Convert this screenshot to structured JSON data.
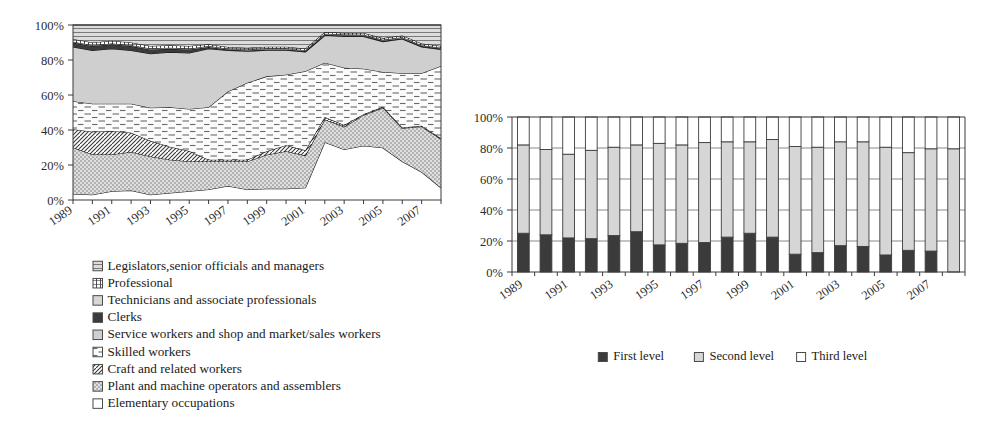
{
  "figure": {
    "panels": [
      "occupation-structure-area-chart",
      "education-level-bar-chart"
    ]
  },
  "colors": {
    "ink": "#1a1a1a",
    "axis": "#3a3a3a",
    "grid": "#7a7a7a",
    "edge": "#141414",
    "light_gray": "#d2d2d2",
    "mid_gray": "#c9c9c9",
    "pale_gray": "#e3e3e3",
    "dark": "#3a3a3a",
    "near_black": "#2e2e2e",
    "white": "#ffffff",
    "bar_first": "#5a5a5a",
    "bar_second": "#d4d4d4",
    "bar_third": "#ffffff"
  },
  "left_chart": {
    "y_axis": {
      "ticks": [
        "0%",
        "20%",
        "40%",
        "60%",
        "80%",
        "100%"
      ],
      "min": 0,
      "max": 100
    },
    "x_axis": {
      "labels": [
        "1989",
        "1991",
        "1993",
        "1995",
        "1997",
        "1999",
        "2001",
        "2003",
        "2005",
        "2007"
      ]
    },
    "legend": [
      {
        "label": "Legislators,senior officials and managers",
        "pattern": "horizontal-lines",
        "swatch": "swatch-legislators"
      },
      {
        "label": "Professional",
        "pattern": "vertical-grid",
        "swatch": "swatch-professional"
      },
      {
        "label": "Technicians and associate professionals",
        "pattern": "solid-light-gray",
        "swatch": "swatch-technicians"
      },
      {
        "label": "Clerks",
        "pattern": "solid-dark",
        "swatch": "swatch-clerks"
      },
      {
        "label": "Service workers and shop and market/sales workers",
        "pattern": "solid-gray",
        "swatch": "swatch-service"
      },
      {
        "label": "Skilled workers",
        "pattern": "dashed-lines",
        "swatch": "swatch-skilled"
      },
      {
        "label": "Craft and related workers",
        "pattern": "diagonal-hatch",
        "swatch": "swatch-craft"
      },
      {
        "label": "Plant and machine operators and assemblers",
        "pattern": "dotted-grid",
        "swatch": "swatch-plant"
      },
      {
        "label": "Elementary occupations",
        "pattern": "blank-white",
        "swatch": "swatch-elementary"
      }
    ]
  },
  "right_chart": {
    "y_axis": {
      "ticks": [
        "0%",
        "20%",
        "40%",
        "60%",
        "80%",
        "100%"
      ],
      "min": 0,
      "max": 100
    },
    "x_axis": {
      "labels": [
        "1989",
        "1991",
        "1993",
        "1995",
        "1997",
        "1999",
        "2001",
        "2003",
        "2005",
        "2007"
      ]
    },
    "legend": [
      {
        "label": "First level",
        "pattern": "solid-dark",
        "swatch": "swatch-first-level"
      },
      {
        "label": "Second level",
        "pattern": "solid-light-gray",
        "swatch": "swatch-second-level"
      },
      {
        "label": "Third level",
        "pattern": "blank-white",
        "swatch": "swatch-third-level"
      }
    ]
  },
  "chart_data": [
    {
      "id": "occupation-structure",
      "type": "area",
      "stacked": true,
      "title": "",
      "xlabel": "",
      "ylabel": "",
      "ylim": [
        0,
        100
      ],
      "grid": false,
      "legend_position": "below",
      "x": [
        1989,
        1990,
        1991,
        1992,
        1993,
        1994,
        1995,
        1996,
        1997,
        1998,
        1999,
        2000,
        2001,
        2002,
        2003,
        2004,
        2005,
        2006,
        2007,
        2008
      ],
      "xtick_labels": [
        "1989",
        "1991",
        "1993",
        "1995",
        "1997",
        "1999",
        "2001",
        "2003",
        "2005",
        "2007"
      ],
      "series": [
        {
          "name": "Elementary occupations",
          "pattern": "blank-white",
          "values": [
            3.5,
            3.0,
            5.0,
            5.5,
            3.0,
            4.0,
            5.0,
            6.0,
            8.0,
            6.0,
            6.5,
            6.5,
            7.0,
            33.0,
            29.0,
            31.0,
            30.0,
            22.0,
            16.0,
            7.0
          ]
        },
        {
          "name": "Plant and machine operators and assemblers",
          "pattern": "dotted-grid",
          "values": [
            26.5,
            23.0,
            21.0,
            22.0,
            22.0,
            19.0,
            17.0,
            16.0,
            14.0,
            16.0,
            19.5,
            21.5,
            18.5,
            13.0,
            13.0,
            17.5,
            23.0,
            19.0,
            26.0,
            28.0
          ]
        },
        {
          "name": "Craft and related workers",
          "pattern": "diagonal-hatch",
          "values": [
            10.5,
            13.0,
            13.5,
            11.0,
            9.0,
            7.5,
            6.0,
            1.0,
            1.0,
            1.0,
            2.0,
            3.5,
            3.0,
            1.5,
            1.0,
            0.5,
            0.5,
            0.5,
            0.5,
            0.5
          ]
        },
        {
          "name": "Skilled workers",
          "pattern": "dashed-lines",
          "values": [
            16.0,
            16.0,
            15.5,
            16.5,
            19.0,
            22.5,
            24.0,
            30.0,
            39.0,
            44.0,
            43.0,
            40.5,
            45.5,
            31.0,
            33.0,
            26.0,
            20.0,
            31.0,
            30.0,
            41.5
          ]
        },
        {
          "name": "Service workers and shop and market/sales workers",
          "pattern": "solid-gray",
          "values": [
            31.0,
            30.5,
            31.5,
            30.5,
            31.0,
            31.5,
            32.0,
            33.5,
            23.5,
            18.0,
            15.0,
            14.0,
            11.0,
            15.5,
            18.0,
            18.5,
            17.5,
            19.5,
            15.0,
            9.5
          ]
        },
        {
          "name": "Clerks",
          "pattern": "solid-dark",
          "values": [
            2.5,
            2.5,
            2.5,
            2.5,
            2.5,
            2.0,
            2.0,
            1.0,
            0.5,
            0.5,
            0.5,
            0.5,
            0.5,
            0.5,
            0.5,
            0.5,
            0.5,
            0.5,
            0.5,
            0.5
          ]
        },
        {
          "name": "Technicians and associate professionals",
          "pattern": "solid-light-gray",
          "values": [
            0.5,
            0.5,
            0.5,
            0.5,
            0.5,
            0.5,
            0.5,
            0.5,
            0.5,
            0.5,
            0.5,
            0.5,
            0.5,
            0.5,
            0.5,
            0.5,
            0.5,
            0.5,
            0.5,
            0.5
          ]
        },
        {
          "name": "Professional",
          "pattern": "vertical-grid",
          "values": [
            1.5,
            1.5,
            1.5,
            1.5,
            1.5,
            1.5,
            1.5,
            1.0,
            1.0,
            1.0,
            1.0,
            1.0,
            1.0,
            1.0,
            1.0,
            1.0,
            1.0,
            1.0,
            1.0,
            1.0
          ]
        },
        {
          "name": "Legislators,senior officials and managers",
          "pattern": "horizontal-lines",
          "values": [
            8.0,
            10.0,
            9.0,
            10.0,
            12.0,
            11.5,
            12.0,
            11.0,
            12.5,
            13.0,
            12.5,
            12.5,
            13.5,
            4.0,
            4.5,
            4.5,
            7.5,
            6.0,
            10.5,
            12.0
          ]
        }
      ]
    },
    {
      "id": "education-level",
      "type": "bar",
      "stacked": true,
      "title": "",
      "xlabel": "",
      "ylabel": "",
      "ylim": [
        0,
        100
      ],
      "grid": true,
      "legend_position": "below",
      "categories": [
        "1989",
        "1990",
        "1991",
        "1992",
        "1993",
        "1994",
        "1995",
        "1996",
        "1997",
        "1998",
        "1999",
        "2000",
        "2001",
        "2002",
        "2003",
        "2004",
        "2005",
        "2006",
        "2007",
        "2008"
      ],
      "xtick_labels": [
        "1989",
        "1991",
        "1993",
        "1995",
        "1997",
        "1999",
        "2001",
        "2003",
        "2005",
        "2007"
      ],
      "series": [
        {
          "name": "First level",
          "pattern": "solid-dark",
          "values": [
            25,
            24,
            22,
            21.5,
            23.5,
            26,
            17.5,
            18.5,
            19,
            22.5,
            25,
            22.5,
            11.5,
            12.5,
            17,
            16.5,
            11,
            14,
            13.5,
            0
          ]
        },
        {
          "name": "Second level",
          "pattern": "solid-light-gray",
          "values": [
            57,
            55,
            54,
            57,
            57,
            56,
            65.5,
            63.5,
            64.5,
            61.5,
            59,
            63,
            69.5,
            68,
            67,
            67.5,
            69.5,
            63,
            66,
            79.5
          ]
        },
        {
          "name": "Third level",
          "pattern": "blank-white",
          "values": [
            18,
            21,
            24,
            21.5,
            19.5,
            18,
            17,
            18,
            16.5,
            16,
            16,
            14.5,
            19,
            19.5,
            16,
            16,
            19.5,
            23,
            20.5,
            20.5
          ]
        }
      ]
    }
  ]
}
